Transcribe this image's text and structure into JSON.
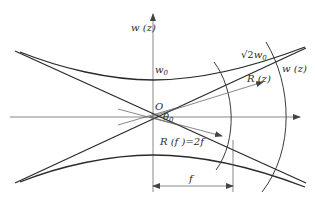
{
  "figure": {
    "type": "gaussian-beam-propagation",
    "labels": {
      "w_axis": "w (z)",
      "w0": "w",
      "w0_sub": "0",
      "sqrt2w0_root": "√2",
      "sqrt2w0_w": "w",
      "sqrt2w0_sub": "0",
      "w_z_right": "w (z)",
      "R_z": "R (z)",
      "origin": "O",
      "theta0": "θ",
      "theta0_sub": "0",
      "R_f": "R (f )=2f",
      "f_dim": "f"
    },
    "colors": {
      "line": "#2a2a2a",
      "axis": "#555555",
      "background": "#ffffff"
    }
  }
}
